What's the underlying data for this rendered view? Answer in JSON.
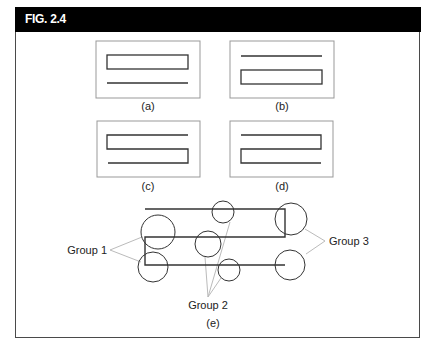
{
  "figure": {
    "title": "FIG. 2.4",
    "colors": {
      "header_bg": "#000000",
      "header_text": "#ffffff",
      "stroke": "#333333",
      "panel_border": "#999999",
      "leader": "#bbbbbb"
    },
    "panels": [
      {
        "id": "a",
        "label": "(a)"
      },
      {
        "id": "b",
        "label": "(b)"
      },
      {
        "id": "c",
        "label": "(c)"
      },
      {
        "id": "d",
        "label": "(d)"
      }
    ],
    "diagram_e": {
      "label": "(e)",
      "groups": [
        {
          "name": "Group 1"
        },
        {
          "name": "Group 2"
        },
        {
          "name": "Group 3"
        }
      ]
    }
  }
}
